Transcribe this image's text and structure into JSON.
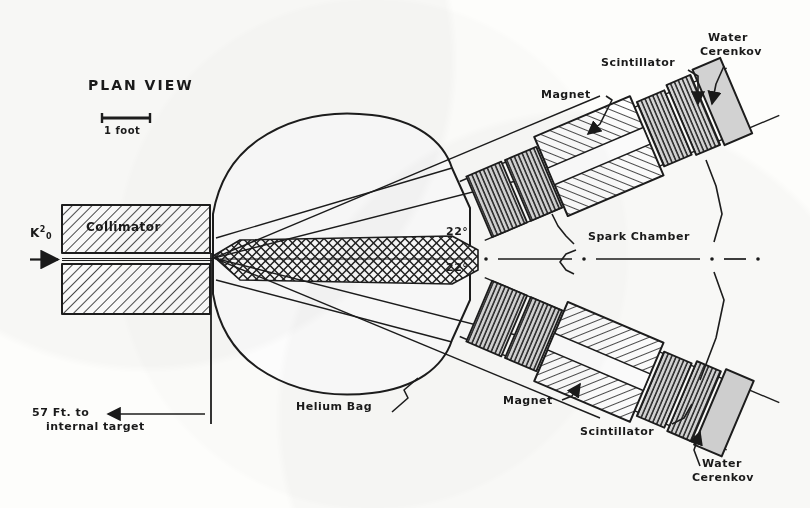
{
  "figure": {
    "title": "PLAN VIEW",
    "scale_bar_label": "1 foot",
    "beam_label_base": "K",
    "beam_label_sup": "2",
    "beam_label_sub": "0",
    "collimator_label": "Collimator",
    "distance_note_line1": "57 Ft. to",
    "distance_note_line2": "internal target",
    "helium_bag_label": "Helium Bag",
    "spark_chamber_label": "Spark Chamber",
    "angle_upper": "22°",
    "angle_lower": "22°",
    "magnet_label_upper": "Magnet",
    "magnet_label_lower": "Magnet",
    "scintillator_label_upper": "Scintillator",
    "scintillator_label_lower": "Scintillator",
    "cerenkov_upper_line1": "Water",
    "cerenkov_upper_line2": "Cerenkov",
    "cerenkov_lower_line1": "Water",
    "cerenkov_lower_line2": "Cerenkov"
  },
  "colors": {
    "ink": "#1a1a1a",
    "line": "#222222",
    "paper": "#fdfdfb",
    "fill_light": "#d9d9d9",
    "fill_mid": "#c4c4c4",
    "hatch": "#333333"
  }
}
